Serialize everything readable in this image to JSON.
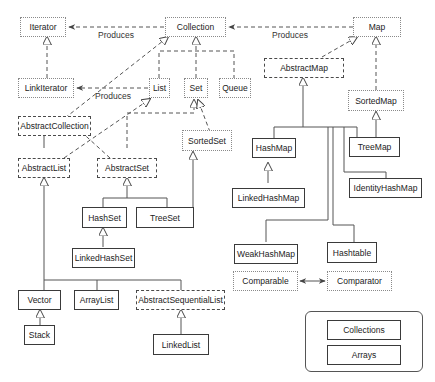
{
  "diagram": {
    "legend_styles": {
      "interface": "dotted border",
      "abstract": "dashed border",
      "concrete": "solid border"
    },
    "nodes": {
      "iterator": {
        "label": "Iterator",
        "kind": "interface"
      },
      "collection": {
        "label": "Collection",
        "kind": "interface"
      },
      "map": {
        "label": "Map",
        "kind": "interface"
      },
      "listiterator": {
        "label": "LinkIterator",
        "kind": "interface"
      },
      "list": {
        "label": "List",
        "kind": "interface"
      },
      "set": {
        "label": "Set",
        "kind": "interface"
      },
      "queue": {
        "label": "Queue",
        "kind": "interface"
      },
      "abstractmap": {
        "label": "AbstractMap",
        "kind": "abstract"
      },
      "sortedmap": {
        "label": "SortedMap",
        "kind": "interface"
      },
      "abstractcollection": {
        "label": "AbstractCollection",
        "kind": "abstract"
      },
      "sortedset": {
        "label": "SortedSet",
        "kind": "interface"
      },
      "abstractlist": {
        "label": "AbstractList",
        "kind": "abstract"
      },
      "abstractset": {
        "label": "AbstractSet",
        "kind": "abstract"
      },
      "hashmap": {
        "label": "HashMap",
        "kind": "concrete"
      },
      "treemap": {
        "label": "TreeMap",
        "kind": "concrete"
      },
      "identityhashmap": {
        "label": "IdentityHashMap",
        "kind": "concrete"
      },
      "hashset": {
        "label": "HashSet",
        "kind": "concrete"
      },
      "treeset": {
        "label": "TreeSet",
        "kind": "concrete"
      },
      "linkedhashmap": {
        "label": "LinkedHashMap",
        "kind": "concrete"
      },
      "linkedhashset": {
        "label": "LinkedHashSet",
        "kind": "concrete"
      },
      "weakhashmap": {
        "label": "WeakHashMap",
        "kind": "concrete"
      },
      "hashtable": {
        "label": "Hashtable",
        "kind": "concrete"
      },
      "comparable": {
        "label": "Comparable",
        "kind": "interface"
      },
      "comparator": {
        "label": "Comparator",
        "kind": "interface"
      },
      "vector": {
        "label": "Vector",
        "kind": "concrete"
      },
      "arraylist": {
        "label": "ArrayList",
        "kind": "concrete"
      },
      "abstractsequentiallist": {
        "label": "AbstractSequentialList",
        "kind": "abstract"
      },
      "stack": {
        "label": "Stack",
        "kind": "concrete"
      },
      "linkedlist": {
        "label": "LinkedList",
        "kind": "concrete"
      },
      "collections": {
        "label": "Collections",
        "kind": "concrete"
      },
      "arrays": {
        "label": "Arrays",
        "kind": "concrete"
      }
    },
    "edge_labels": {
      "collection_produces_iterator": "Produces",
      "map_produces_collection": "Produces",
      "list_produces_listiterator": "Produces"
    },
    "edges": [
      {
        "from": "Collection",
        "to": "Iterator",
        "type": "produces"
      },
      {
        "from": "Map",
        "to": "Collection",
        "type": "produces"
      },
      {
        "from": "List",
        "to": "LinkIterator",
        "type": "produces"
      },
      {
        "from": "LinkIterator",
        "to": "Iterator",
        "type": "extends"
      },
      {
        "from": "List",
        "to": "Collection",
        "type": "extends"
      },
      {
        "from": "Set",
        "to": "Collection",
        "type": "extends"
      },
      {
        "from": "Queue",
        "to": "Collection",
        "type": "extends"
      },
      {
        "from": "AbstractCollection",
        "to": "Collection",
        "type": "implements"
      },
      {
        "from": "AbstractList",
        "to": "List",
        "type": "implements"
      },
      {
        "from": "AbstractList",
        "to": "AbstractCollection",
        "type": "extends"
      },
      {
        "from": "AbstractSet",
        "to": "AbstractCollection",
        "type": "extends"
      },
      {
        "from": "AbstractSet",
        "to": "Set",
        "type": "implements"
      },
      {
        "from": "SortedSet",
        "to": "Set",
        "type": "extends"
      },
      {
        "from": "HashSet",
        "to": "AbstractSet",
        "type": "extends"
      },
      {
        "from": "TreeSet",
        "to": "AbstractSet",
        "type": "extends"
      },
      {
        "from": "TreeSet",
        "to": "SortedSet",
        "type": "implements"
      },
      {
        "from": "LinkedHashSet",
        "to": "HashSet",
        "type": "extends"
      },
      {
        "from": "Vector",
        "to": "AbstractList",
        "type": "extends"
      },
      {
        "from": "ArrayList",
        "to": "AbstractList",
        "type": "extends"
      },
      {
        "from": "AbstractSequentialList",
        "to": "AbstractList",
        "type": "extends"
      },
      {
        "from": "Stack",
        "to": "Vector",
        "type": "extends"
      },
      {
        "from": "LinkedList",
        "to": "AbstractSequentialList",
        "type": "extends"
      },
      {
        "from": "AbstractMap",
        "to": "Map",
        "type": "implements"
      },
      {
        "from": "SortedMap",
        "to": "Map",
        "type": "extends"
      },
      {
        "from": "HashMap",
        "to": "AbstractMap",
        "type": "extends"
      },
      {
        "from": "TreeMap",
        "to": "AbstractMap",
        "type": "extends"
      },
      {
        "from": "TreeMap",
        "to": "SortedMap",
        "type": "implements"
      },
      {
        "from": "IdentityHashMap",
        "to": "AbstractMap",
        "type": "extends"
      },
      {
        "from": "WeakHashMap",
        "to": "AbstractMap",
        "type": "extends"
      },
      {
        "from": "Hashtable",
        "to": "AbstractMap",
        "type": "extends"
      },
      {
        "from": "LinkedHashMap",
        "to": "HashMap",
        "type": "extends"
      },
      {
        "from": "Comparable",
        "to": "Comparator",
        "type": "association"
      }
    ],
    "colors": {
      "interface_border": "#8a8a8a",
      "abstract_border": "#4a4a4a",
      "concrete_border": "#3a3a3a",
      "line": "#444444",
      "background": "#ffffff"
    }
  }
}
